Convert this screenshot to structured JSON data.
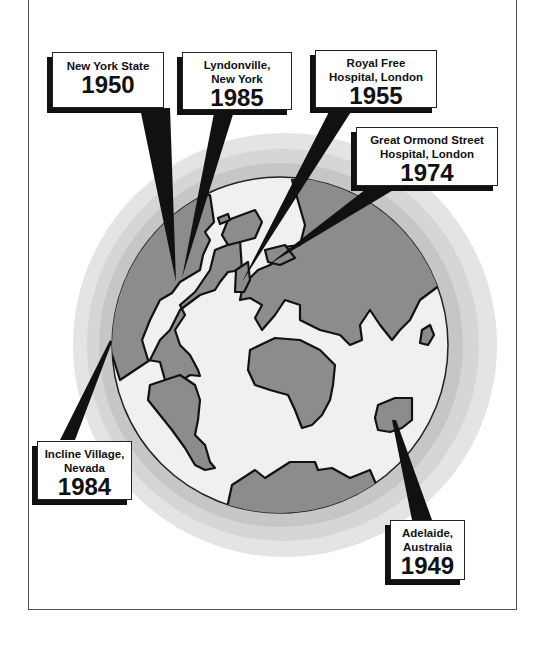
{
  "diagram": {
    "callouts": [
      {
        "id": "new-york-state",
        "place_lines": [
          "New York State"
        ],
        "year": "1950"
      },
      {
        "id": "lyndonville",
        "place_lines": [
          "Lyndonville,",
          "New York"
        ],
        "year": "1985"
      },
      {
        "id": "royal-free",
        "place_lines": [
          "Royal Free",
          "Hospital, London"
        ],
        "year": "1955"
      },
      {
        "id": "great-ormond-street",
        "place_lines": [
          "Great Ormond Street",
          "Hospital, London"
        ],
        "year": "1974"
      },
      {
        "id": "incline-village",
        "place_lines": [
          "Incline Village,",
          "Nevada"
        ],
        "year": "1984"
      },
      {
        "id": "adelaide",
        "place_lines": [
          "Adelaide,",
          "Australia"
        ],
        "year": "1949"
      }
    ]
  },
  "colors": {
    "halo_outer": "#e4e4e4",
    "halo_mid": "#d2d2d2",
    "halo_inner": "#c0c0c0",
    "ocean": "#f0f0f0",
    "land": "#8c8c8c",
    "ink": "#111111"
  }
}
